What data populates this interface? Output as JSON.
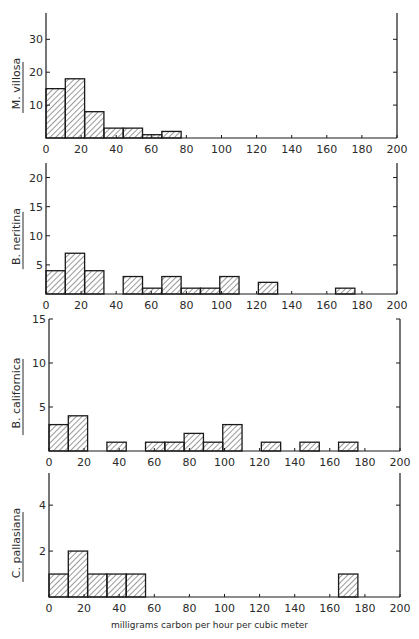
{
  "chart_data": {
    "type": "bar",
    "subtype": "histogram",
    "xlabel": "milligrams carbon per hour per cubic meter",
    "x_ticks": [
      0,
      20,
      40,
      60,
      80,
      100,
      120,
      140,
      160,
      180,
      200
    ],
    "xlim": [
      0,
      200
    ],
    "bin_width": 11,
    "panels": [
      {
        "ylabel": "M. villosa",
        "ylim": [
          0,
          38
        ],
        "y_ticks": [
          10,
          20,
          30
        ],
        "bins": [
          {
            "start": 0,
            "end": 11,
            "count": 15
          },
          {
            "start": 11,
            "end": 22,
            "count": 18
          },
          {
            "start": 22,
            "end": 33,
            "count": 8
          },
          {
            "start": 33,
            "end": 44,
            "count": 3
          },
          {
            "start": 44,
            "end": 55,
            "count": 3
          },
          {
            "start": 55,
            "end": 66,
            "count": 1
          },
          {
            "start": 66,
            "end": 77,
            "count": 2
          }
        ]
      },
      {
        "ylabel": "B. neritina",
        "ylim": [
          0,
          22.5
        ],
        "y_ticks": [
          5,
          10,
          15,
          20
        ],
        "bins": [
          {
            "start": 0,
            "end": 11,
            "count": 4
          },
          {
            "start": 11,
            "end": 22,
            "count": 7
          },
          {
            "start": 22,
            "end": 33,
            "count": 4
          },
          {
            "start": 44,
            "end": 55,
            "count": 3
          },
          {
            "start": 55,
            "end": 66,
            "count": 1
          },
          {
            "start": 66,
            "end": 77,
            "count": 3
          },
          {
            "start": 77,
            "end": 88,
            "count": 1
          },
          {
            "start": 88,
            "end": 99,
            "count": 1
          },
          {
            "start": 99,
            "end": 110,
            "count": 3
          },
          {
            "start": 121,
            "end": 132,
            "count": 2
          },
          {
            "start": 165,
            "end": 176,
            "count": 1
          }
        ]
      },
      {
        "ylabel": "B. californica",
        "ylim": [
          0,
          15
        ],
        "y_ticks": [
          5,
          10,
          15
        ],
        "bins": [
          {
            "start": 0,
            "end": 11,
            "count": 3
          },
          {
            "start": 11,
            "end": 22,
            "count": 4
          },
          {
            "start": 33,
            "end": 44,
            "count": 1
          },
          {
            "start": 55,
            "end": 66,
            "count": 1
          },
          {
            "start": 66,
            "end": 77,
            "count": 1
          },
          {
            "start": 77,
            "end": 88,
            "count": 2
          },
          {
            "start": 88,
            "end": 99,
            "count": 1
          },
          {
            "start": 99,
            "end": 110,
            "count": 3
          },
          {
            "start": 121,
            "end": 132,
            "count": 1
          },
          {
            "start": 143,
            "end": 154,
            "count": 1
          },
          {
            "start": 165,
            "end": 176,
            "count": 1
          }
        ]
      },
      {
        "ylabel": "C. pallasiana",
        "ylim": [
          0,
          5.4
        ],
        "y_ticks": [
          2,
          4
        ],
        "bins": [
          {
            "start": 0,
            "end": 11,
            "count": 1
          },
          {
            "start": 11,
            "end": 22,
            "count": 2
          },
          {
            "start": 22,
            "end": 33,
            "count": 1
          },
          {
            "start": 33,
            "end": 44,
            "count": 1
          },
          {
            "start": 44,
            "end": 55,
            "count": 1
          },
          {
            "start": 165,
            "end": 176,
            "count": 1
          }
        ]
      }
    ],
    "grid": false,
    "legend": null
  },
  "layout": {
    "panels": [
      {
        "x0": 46,
        "x1": 397,
        "top": 13,
        "base": 138
      },
      {
        "x0": 46,
        "x1": 397,
        "top": 163,
        "base": 294
      },
      {
        "x0": 49,
        "x1": 400,
        "top": 319,
        "base": 451
      },
      {
        "x0": 49,
        "x1": 400,
        "top": 473,
        "base": 597
      }
    ]
  }
}
